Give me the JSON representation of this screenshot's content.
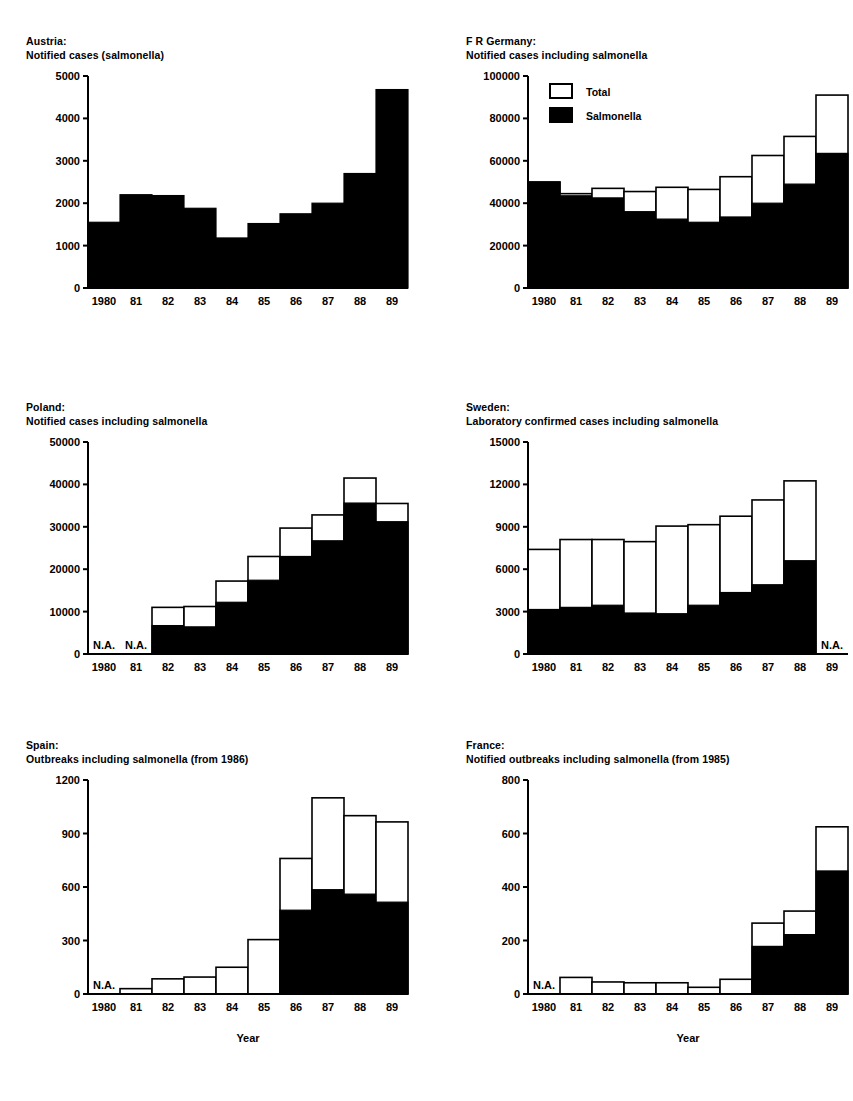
{
  "figure": {
    "background": "#ffffff",
    "ink": "#000000",
    "panel_count": 6
  },
  "legend": {
    "total_label": "Total",
    "salmonella_label": "Salmonella",
    "total_color": "#ffffff",
    "salmonella_color": "#000000",
    "shown_in_panel": "F R Germany"
  },
  "axis_titles": {
    "x": "Year"
  },
  "na_text": "N.A.",
  "chart_data": [
    {
      "id": "austria",
      "type": "bar",
      "title": "Austria:",
      "subtitle": "Notified cases (salmonella)",
      "title_lines": [
        "Austria:",
        "Notified cases (salmonella)"
      ],
      "xlabel": "",
      "ylabel": "",
      "categories": [
        "1980",
        "81",
        "82",
        "83",
        "84",
        "85",
        "86",
        "87",
        "88",
        "89"
      ],
      "tick_labels_y": [
        "0",
        "1000",
        "2000",
        "3000",
        "4000",
        "5000"
      ],
      "ylim": [
        0,
        5000
      ],
      "ytick_step": 1000,
      "grid": false,
      "legend_position": "none",
      "series": [
        {
          "name": "Salmonella",
          "color": "#000000",
          "values": [
            1550,
            2200,
            2180,
            1880,
            1180,
            1520,
            1750,
            2000,
            2700,
            4680
          ]
        }
      ],
      "na_years": []
    },
    {
      "id": "fr_germany",
      "type": "bar",
      "title": "F R Germany:",
      "subtitle": "Notified cases including salmonella",
      "title_lines": [
        "F R Germany:",
        "Notified cases including salmonella"
      ],
      "xlabel": "",
      "ylabel": "",
      "categories": [
        "1980",
        "81",
        "82",
        "83",
        "84",
        "85",
        "86",
        "87",
        "88",
        "89"
      ],
      "tick_labels_y": [
        "0",
        "20000",
        "40000",
        "60000",
        "80000",
        "100000"
      ],
      "ylim": [
        0,
        100000
      ],
      "ytick_step": 20000,
      "grid": false,
      "legend_position": "inside-top-left",
      "series": [
        {
          "name": "Total",
          "color": "#ffffff",
          "values": [
            50000,
            44500,
            47000,
            45500,
            47500,
            46500,
            52500,
            62500,
            71500,
            91000
          ]
        },
        {
          "name": "Salmonella",
          "color": "#000000",
          "values": [
            50000,
            43500,
            42500,
            36000,
            32500,
            31000,
            33500,
            40000,
            49000,
            63500
          ]
        }
      ],
      "na_years": []
    },
    {
      "id": "poland",
      "type": "bar",
      "title": "Poland:",
      "subtitle": "Notified cases including salmonella",
      "title_lines": [
        "Poland:",
        "Notified cases including salmonella"
      ],
      "xlabel": "",
      "ylabel": "",
      "categories": [
        "1980",
        "81",
        "82",
        "83",
        "84",
        "85",
        "86",
        "87",
        "88",
        "89"
      ],
      "tick_labels_y": [
        "0",
        "10000",
        "20000",
        "30000",
        "40000",
        "50000"
      ],
      "ylim": [
        0,
        50000
      ],
      "ytick_step": 10000,
      "grid": false,
      "legend_position": "none",
      "series": [
        {
          "name": "Total",
          "color": "#ffffff",
          "values": [
            null,
            null,
            11000,
            11200,
            17200,
            23000,
            29700,
            32800,
            41500,
            35500
          ]
        },
        {
          "name": "Salmonella",
          "color": "#000000",
          "values": [
            null,
            null,
            6700,
            6400,
            12200,
            17400,
            23000,
            26700,
            35600,
            31200
          ]
        }
      ],
      "na_years": [
        "1980",
        "81"
      ]
    },
    {
      "id": "sweden",
      "type": "bar",
      "title": "Sweden:",
      "subtitle": "Laboratory confirmed cases including salmonella",
      "title_lines": [
        "Sweden:",
        "Laboratory confirmed cases including salmonella"
      ],
      "xlabel": "",
      "ylabel": "",
      "categories": [
        "1980",
        "81",
        "82",
        "83",
        "84",
        "85",
        "86",
        "87",
        "88",
        "89"
      ],
      "tick_labels_y": [
        "0",
        "3000",
        "6000",
        "9000",
        "12000",
        "15000"
      ],
      "ylim": [
        0,
        15000
      ],
      "ytick_step": 3000,
      "grid": false,
      "legend_position": "none",
      "series": [
        {
          "name": "Total",
          "color": "#ffffff",
          "values": [
            7400,
            8100,
            8100,
            7950,
            9050,
            9150,
            9750,
            10900,
            12250,
            null
          ]
        },
        {
          "name": "Salmonella",
          "color": "#000000",
          "values": [
            3150,
            3300,
            3450,
            2900,
            2850,
            3450,
            4350,
            4900,
            6600,
            null
          ]
        }
      ],
      "na_years": [
        "89"
      ]
    },
    {
      "id": "spain",
      "type": "bar",
      "title": "Spain:",
      "subtitle": "Outbreaks including salmonella (from 1986)",
      "title_lines": [
        "Spain:",
        "Outbreaks including salmonella (from 1986)"
      ],
      "xlabel": "Year",
      "ylabel": "",
      "categories": [
        "1980",
        "81",
        "82",
        "83",
        "84",
        "85",
        "86",
        "87",
        "88",
        "89"
      ],
      "tick_labels_y": [
        "0",
        "300",
        "600",
        "900",
        "1200"
      ],
      "ylim": [
        0,
        1200
      ],
      "ytick_step": 300,
      "grid": false,
      "legend_position": "none",
      "series": [
        {
          "name": "Total",
          "color": "#ffffff",
          "values": [
            null,
            30,
            85,
            95,
            150,
            305,
            760,
            1100,
            1000,
            965
          ]
        },
        {
          "name": "Salmonella",
          "color": "#000000",
          "values": [
            null,
            0,
            0,
            0,
            0,
            0,
            470,
            585,
            560,
            515
          ]
        }
      ],
      "na_years": [
        "1980"
      ]
    },
    {
      "id": "france",
      "type": "bar",
      "title": "France:",
      "subtitle": "Notified outbreaks including salmonella (from 1985)",
      "title_lines": [
        "France:",
        "Notified outbreaks including salmonella (from 1985)"
      ],
      "xlabel": "Year",
      "ylabel": "",
      "categories": [
        "1980",
        "81",
        "82",
        "83",
        "84",
        "85",
        "86",
        "87",
        "88",
        "89"
      ],
      "tick_labels_y": [
        "0",
        "200",
        "400",
        "600",
        "800"
      ],
      "ylim": [
        0,
        800
      ],
      "ytick_step": 200,
      "grid": false,
      "legend_position": "none",
      "series": [
        {
          "name": "Total",
          "color": "#ffffff",
          "values": [
            null,
            62,
            45,
            42,
            42,
            25,
            55,
            265,
            310,
            625
          ]
        },
        {
          "name": "Salmonella",
          "color": "#000000",
          "values": [
            null,
            0,
            0,
            0,
            0,
            0,
            0,
            178,
            222,
            460
          ]
        }
      ],
      "na_years": [
        "1980"
      ]
    }
  ]
}
